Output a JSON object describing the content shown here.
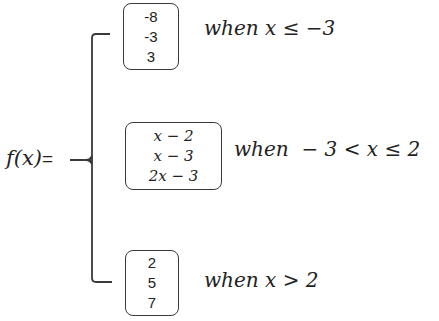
{
  "function_label": {
    "name": "f(x)",
    "equals": "="
  },
  "cases": [
    {
      "values": [
        "-8",
        "-3",
        "3"
      ],
      "condition": "when x ≤ −3"
    },
    {
      "values": [
        "x − 2",
        "x − 3",
        "2x − 3"
      ],
      "condition": "when  − 3 < x ≤ 2"
    },
    {
      "values": [
        "2",
        "5",
        "7"
      ],
      "condition": "when x > 2"
    }
  ],
  "colors": {
    "stroke": "#3a3a3a",
    "text": "#222222",
    "background": "#ffffff"
  }
}
